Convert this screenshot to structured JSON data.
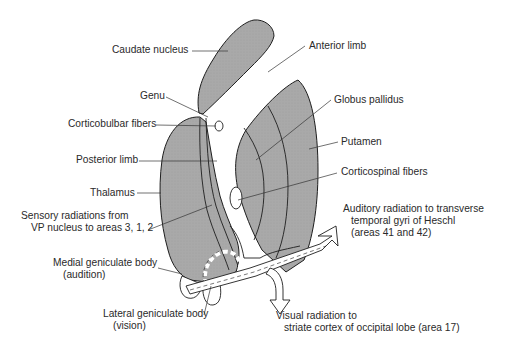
{
  "diagram": {
    "colors": {
      "structure_fill": "#a9a9a9",
      "outline": "#1e1e1e",
      "leader_line": "#333333",
      "background": "#ffffff",
      "text": "#2a2a2a"
    },
    "labels": {
      "caudate_nucleus": "Caudate nucleus",
      "anterior_limb": "Anterior limb",
      "genu": "Genu",
      "corticobulbar_fibers": "Corticobulbar fibers",
      "globus_pallidus": "Globus pallidus",
      "putamen": "Putamen",
      "posterior_limb": "Posterior limb",
      "corticospinal_fibers": "Corticospinal fibers",
      "thalamus": "Thalamus",
      "sensory_radiations_line1": "Sensory radiations from",
      "sensory_radiations_line2": "VP nucleus to areas 3, 1, 2",
      "auditory_radiation_line1": "Auditory radiation to transverse",
      "auditory_radiation_line2": "temporal gyri of Heschl",
      "auditory_radiation_line3": "(areas 41 and 42)",
      "medial_geniculate_line1": "Medial geniculate body",
      "medial_geniculate_line2": "(audition)",
      "lateral_geniculate_line1": "Lateral geniculate body",
      "lateral_geniculate_line2": "(vision)",
      "visual_radiation_line1": "Visual radiation to",
      "visual_radiation_line2": "striate cortex of occipital lobe (area 17)"
    }
  }
}
